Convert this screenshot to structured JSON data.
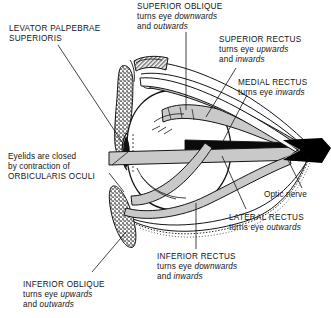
{
  "diagram": {
    "type": "anatomical-line-drawing",
    "background_color": "#ffffff",
    "ink_color": "#141414",
    "muscle_fill_color": "#c9c9c9",
    "bone_shade_color": "#8a8a8a",
    "optic_nerve_color": "#000000"
  },
  "labels": {
    "levator": {
      "name": "LEVATOR PALPEBRAE",
      "line2": "SUPERIORIS"
    },
    "superior_oblique": {
      "name": "SUPERIOR OBLIQUE",
      "action_prefix": "turns eye ",
      "action_1": "downwards",
      "and": "and ",
      "action_2": "outwards"
    },
    "superior_rectus": {
      "name": "SUPERIOR RECTUS",
      "action_prefix": "turns eye ",
      "action_1": "upwards",
      "and": "and ",
      "action_2": "inwards"
    },
    "medial_rectus": {
      "name": "MEDIAL RECTUS",
      "action_prefix": "turns eye ",
      "action_1": "inwards"
    },
    "orbicularis": {
      "line1": "Eyelids  are closed",
      "line2": "by contraction of",
      "line3": "ORBICULARIS OCULI"
    },
    "optic_nerve": {
      "name": "Optic nerve"
    },
    "lateral_rectus": {
      "name": "LATERAL RECTUS",
      "action_prefix": "turns eye ",
      "action_1": "outwards"
    },
    "inferior_rectus": {
      "name": "INFERIOR RECTUS",
      "action_prefix": "turns eye ",
      "action_1": "downwards",
      "and": "and ",
      "action_2": "inwards"
    },
    "inferior_oblique": {
      "name": "INFERIOR OBLIQUE",
      "action_prefix": "turns eye ",
      "action_1": "upwards",
      "and": "and ",
      "action_2": "outwards"
    }
  }
}
